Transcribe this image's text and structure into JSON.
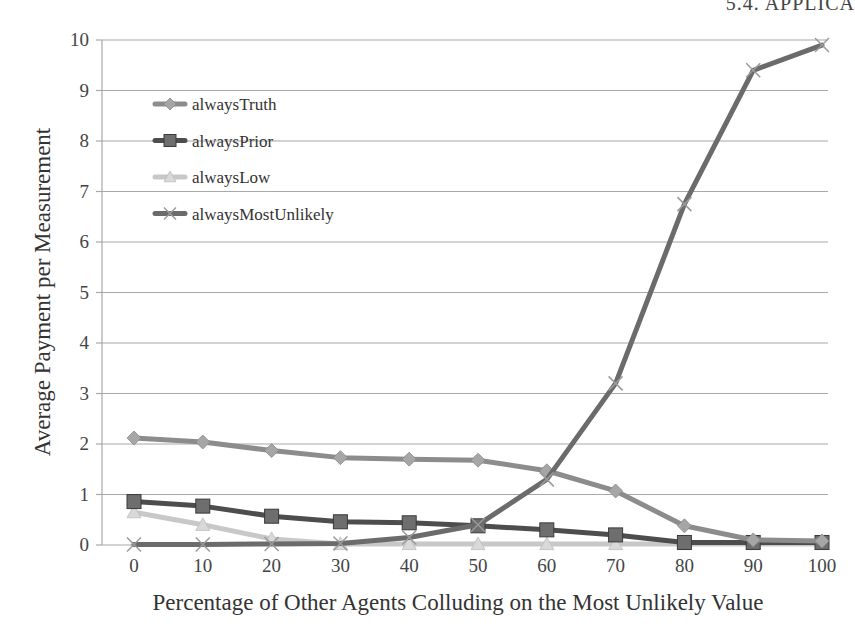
{
  "page": {
    "header_text": "5.4. APPLICA"
  },
  "chart_data": {
    "type": "line",
    "title": "",
    "xlabel": "Percentage of Other Agents Colluding on the Most Unlikely Value",
    "ylabel": "Average Payment per Measurement",
    "x": [
      0,
      10,
      20,
      30,
      40,
      50,
      60,
      70,
      80,
      90,
      100
    ],
    "x_tick_labels": [
      "0",
      "10",
      "20",
      "30",
      "40",
      "50",
      "60",
      "70",
      "80",
      "90",
      "100"
    ],
    "y_tick_labels": [
      "0",
      "1",
      "2",
      "3",
      "4",
      "5",
      "6",
      "7",
      "8",
      "9",
      "10"
    ],
    "ylim": [
      0,
      10
    ],
    "xlim": [
      0,
      100
    ],
    "grid": "horizontal",
    "legend_position": "upper-left (inside)",
    "series": [
      {
        "name": "alwaysTruth",
        "marker": "diamond",
        "color": "#8c8c8c",
        "marker_color": "#a6a6a6",
        "values": [
          2.12,
          2.04,
          1.87,
          1.73,
          1.7,
          1.68,
          1.47,
          1.07,
          0.38,
          0.1,
          0.08
        ]
      },
      {
        "name": "alwaysPrior",
        "marker": "square",
        "color": "#4d4d4d",
        "marker_color": "#6e6e6e",
        "values": [
          0.86,
          0.77,
          0.57,
          0.46,
          0.44,
          0.38,
          0.3,
          0.2,
          0.05,
          0.05,
          0.05
        ]
      },
      {
        "name": "alwaysLow",
        "marker": "triangle",
        "color": "#c8c8c8",
        "marker_color": "#d9d9d9",
        "values": [
          0.65,
          0.4,
          0.12,
          0.02,
          0.02,
          0.02,
          0.02,
          0.02,
          0.02,
          0.02,
          0.02
        ]
      },
      {
        "name": "alwaysMostUnlikely",
        "marker": "x",
        "color": "#6b6b6b",
        "marker_color": "#9a9a9a",
        "values": [
          0.01,
          0.01,
          0.02,
          0.03,
          0.15,
          0.4,
          1.3,
          3.2,
          6.75,
          9.4,
          9.9
        ]
      }
    ]
  }
}
